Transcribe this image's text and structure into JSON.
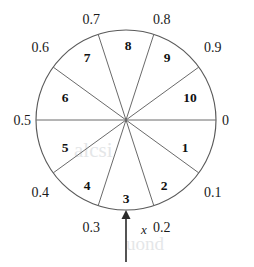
{
  "figure": {
    "background_color": "#ffffff",
    "line_color": "#5a5a5a",
    "text_color": "#111111"
  },
  "circle": {
    "center_x": 126,
    "center_y": 120,
    "radius": 90,
    "sector_count": 10
  },
  "chart_data": {
    "type": "pie",
    "title": "",
    "xlabel": "",
    "ylabel": "",
    "categories": [
      "1",
      "2",
      "3",
      "4",
      "5",
      "6",
      "7",
      "8",
      "9",
      "10"
    ],
    "values": [
      10,
      10,
      10,
      10,
      10,
      10,
      10,
      10,
      10,
      10
    ],
    "legend_position": "none",
    "grid": false
  },
  "tick_labels": [
    {
      "id": "tick-0",
      "text": "0",
      "scale": 0.0,
      "x": 222,
      "y": 125,
      "anchor": "start"
    },
    {
      "id": "tick-0p1",
      "text": "0.1",
      "scale": 0.1,
      "x": 204,
      "y": 197,
      "anchor": "start"
    },
    {
      "id": "tick-0p2",
      "text": "0.2",
      "scale": 0.2,
      "x": 153,
      "y": 232,
      "anchor": "start"
    },
    {
      "id": "tick-0p3",
      "text": "0.3",
      "scale": 0.3,
      "x": 100,
      "y": 232,
      "anchor": "end"
    },
    {
      "id": "tick-0p4",
      "text": "0.4",
      "scale": 0.4,
      "x": 49,
      "y": 197,
      "anchor": "end"
    },
    {
      "id": "tick-0p5",
      "text": "0.5",
      "scale": 0.5,
      "x": 31,
      "y": 125,
      "anchor": "end"
    },
    {
      "id": "tick-0p6",
      "text": "0.6",
      "scale": 0.6,
      "x": 49,
      "y": 52,
      "anchor": "end"
    },
    {
      "id": "tick-0p7",
      "text": "0.7",
      "scale": 0.7,
      "x": 100,
      "y": 24,
      "anchor": "end"
    },
    {
      "id": "tick-0p8",
      "text": "0.8",
      "scale": 0.8,
      "x": 153,
      "y": 24,
      "anchor": "start"
    },
    {
      "id": "tick-0p9",
      "text": "0.9",
      "scale": 0.9,
      "x": 204,
      "y": 52,
      "anchor": "start"
    }
  ],
  "sector_labels": [
    {
      "id": "sector-1",
      "text": "1",
      "x": 185,
      "y": 152
    },
    {
      "id": "sector-2",
      "text": "2",
      "x": 164,
      "y": 190
    },
    {
      "id": "sector-3",
      "text": "3",
      "x": 126,
      "y": 203
    },
    {
      "id": "sector-4",
      "text": "4",
      "x": 87,
      "y": 190
    },
    {
      "id": "sector-5",
      "text": "5",
      "x": 65,
      "y": 152
    },
    {
      "id": "sector-6",
      "text": "6",
      "x": 65,
      "y": 102
    },
    {
      "id": "sector-7",
      "text": "7",
      "x": 87,
      "y": 62
    },
    {
      "id": "sector-8",
      "text": "8",
      "x": 128,
      "y": 50
    },
    {
      "id": "sector-9",
      "text": "9",
      "x": 167,
      "y": 62
    },
    {
      "id": "sector-10",
      "text": "10",
      "x": 190,
      "y": 102
    }
  ],
  "pointer": {
    "label": "x",
    "label_x": 141,
    "label_y": 234,
    "tip_x": 126,
    "tip_y": 211,
    "tail_y": 262,
    "scale_position": 0.25
  },
  "watermark": {
    "line1": "alcsi",
    "line2": "uond"
  }
}
